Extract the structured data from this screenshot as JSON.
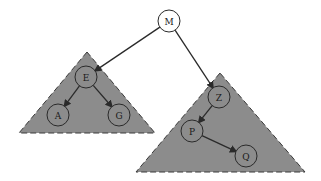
{
  "diagram": {
    "type": "binary-search-tree-with-subtrees",
    "colors": {
      "subtree_fill": "#8c8c8c",
      "subtree_border": "#3a3a3a",
      "node_stroke": "#2a2a2a",
      "root_fill": "#ffffff",
      "edge": "#2a2a2a"
    },
    "root": {
      "id": "M",
      "label": "M",
      "cx": 169,
      "cy": 21
    },
    "subtrees": [
      {
        "id": "left",
        "points": "87,52 19,133 155,133"
      },
      {
        "id": "right",
        "points": "220,73 136,172 305,172"
      }
    ],
    "nodes": [
      {
        "id": "E",
        "label": "E",
        "cx": 86,
        "cy": 77
      },
      {
        "id": "A",
        "label": "A",
        "cx": 58,
        "cy": 115
      },
      {
        "id": "G",
        "label": "G",
        "cx": 119,
        "cy": 115
      },
      {
        "id": "Z",
        "label": "Z",
        "cx": 219,
        "cy": 97
      },
      {
        "id": "P",
        "label": "P",
        "cx": 192,
        "cy": 131
      },
      {
        "id": "Q",
        "label": "Q",
        "cx": 246,
        "cy": 156
      }
    ],
    "edges": [
      {
        "from": "M",
        "to": "E"
      },
      {
        "from": "M",
        "to": "Z"
      },
      {
        "from": "E",
        "to": "A"
      },
      {
        "from": "E",
        "to": "G"
      },
      {
        "from": "Z",
        "to": "P"
      },
      {
        "from": "P",
        "to": "Q"
      }
    ],
    "node_radius": 11
  }
}
